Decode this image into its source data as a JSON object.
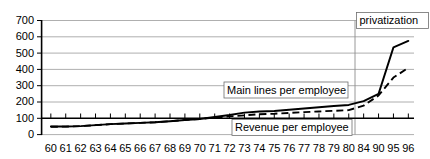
{
  "chart_data": {
    "type": "line",
    "title": "",
    "subtitle": "",
    "xlabel": "",
    "ylabel": "",
    "xlim": [
      0,
      26
    ],
    "ylim": [
      0,
      700
    ],
    "ytick_values": [
      0,
      100,
      200,
      300,
      400,
      500,
      600,
      700
    ],
    "ytick_labels": [
      "0",
      "100",
      "200",
      "300",
      "400",
      "500",
      "600",
      "700"
    ],
    "categories": [
      "60",
      "61",
      "62",
      "63",
      "64",
      "65",
      "66",
      "67",
      "68",
      "69",
      "70",
      "71",
      "72",
      "73",
      "74",
      "75",
      "76",
      "77",
      "78",
      "79",
      "80",
      "84",
      "90",
      "95",
      "96"
    ],
    "grid": true,
    "legend_position": "inline-annotations",
    "series": [
      {
        "name": "Main lines per employee",
        "style": "solid",
        "values": [
          50,
          50,
          52,
          58,
          64,
          68,
          72,
          76,
          82,
          90,
          96,
          108,
          120,
          135,
          142,
          145,
          152,
          160,
          168,
          175,
          182,
          205,
          250,
          535,
          575
        ]
      },
      {
        "name": "Revenue per employee",
        "style": "dashed",
        "values": [
          48,
          49,
          52,
          58,
          64,
          68,
          72,
          76,
          82,
          90,
          96,
          104,
          112,
          118,
          125,
          128,
          133,
          138,
          142,
          146,
          150,
          178,
          240,
          350,
          410
        ]
      }
    ],
    "annotations": [
      {
        "id": "privatization",
        "text": "privatization",
        "kind": "boxed-label-with-marker-line",
        "x_category": "84"
      },
      {
        "id": "main-lines-label",
        "text": "Main lines per employee",
        "kind": "boxed-series-label",
        "series": "Main lines per employee"
      },
      {
        "id": "revenue-label",
        "text": "Revenue per employee",
        "kind": "boxed-series-label",
        "series": "Revenue per employee"
      }
    ]
  },
  "colors": {
    "background": "#ffffff",
    "gridline": "#9a9a9a",
    "axis": "#000000",
    "series": "#000000",
    "marker_line": "#8c8c8c",
    "box_border": "#6e6e6e"
  }
}
